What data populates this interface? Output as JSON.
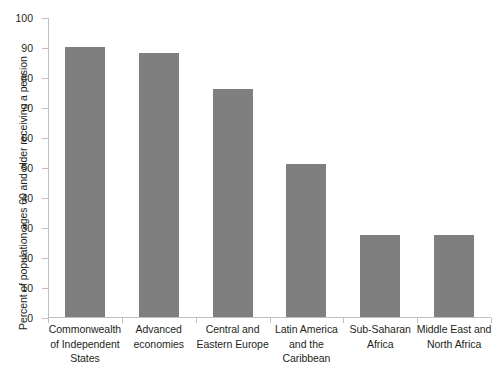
{
  "chart_data": {
    "type": "bar",
    "title": "",
    "subtitle": "",
    "xlabel": "",
    "ylabel": "Percent of population ages 60 and older receiving a pension",
    "ylim": [
      0,
      100
    ],
    "ytick_step": 10,
    "yticks": [
      "100",
      "90",
      "80",
      "70",
      "60",
      "50",
      "40",
      "30",
      "20",
      "10",
      "0"
    ],
    "grid": false,
    "legend": false,
    "bar_color": "#7f7f7f",
    "axis_color": "#bfbfbf",
    "text_color": "#231f20",
    "background": "#ffffff",
    "categories": [
      "Commonwealth of Independent States",
      "Advanced economies",
      "Central and Eastern Europe",
      "Latin America and the Caribbean",
      "Sub-Saharan Africa",
      "Middle East and North Africa"
    ],
    "category_lines": [
      [
        "Commonwealth",
        "of Independent",
        "States"
      ],
      [
        "Advanced",
        "economies"
      ],
      [
        "Central and",
        "Eastern Europe"
      ],
      [
        "Latin America",
        "and the",
        "Caribbean"
      ],
      [
        "Sub-Saharan",
        "Africa"
      ],
      [
        "Middle East and",
        "North Africa"
      ]
    ],
    "values": [
      90,
      88,
      76,
      51,
      27.5,
      27.5
    ],
    "series": [
      {
        "name": "Percent receiving a pension",
        "values": [
          90,
          88,
          76,
          51,
          27.5,
          27.5
        ]
      }
    ]
  }
}
